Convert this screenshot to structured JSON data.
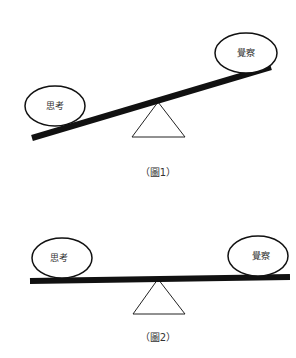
{
  "figure1": {
    "caption": "（圖1）",
    "left_label": "思考",
    "right_label": "覺察",
    "state": "tilted: left side down, right side up"
  },
  "figure2": {
    "caption": "（圖2）",
    "left_label": "思考",
    "right_label": "覺察",
    "state": "balanced"
  }
}
